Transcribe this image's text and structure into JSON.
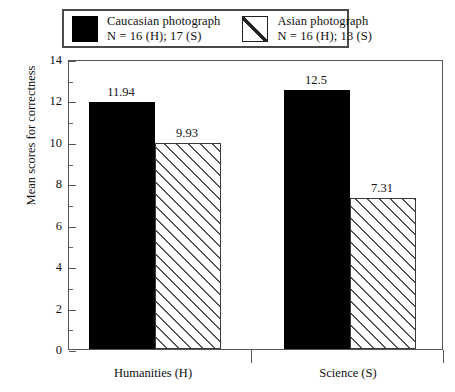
{
  "chart_data": {
    "type": "bar",
    "title": "",
    "xlabel": "",
    "ylabel": "Mean scores for correctness",
    "ylim": [
      0,
      14
    ],
    "ytick_step": 2,
    "yminor_step": 1,
    "grid": false,
    "legend_position": "top",
    "categories": [
      "Humanities (H)",
      "Science (S)"
    ],
    "series": [
      {
        "name": "Caucasian photograph",
        "sublabel": "N = 16 (H); 17 (S)",
        "fill": "solid-black",
        "color": "#000000",
        "values": [
          11.94,
          12.5
        ],
        "value_labels": [
          "11.94",
          "12.5"
        ]
      },
      {
        "name": "Asian photograph",
        "sublabel": "N = 16 (H); 13 (S)",
        "fill": "diagonal-hatch",
        "color": "#ffffff",
        "values": [
          9.93,
          7.31
        ],
        "value_labels": [
          "9.93",
          "7.31"
        ]
      }
    ],
    "ytick_labels": [
      "14",
      "12",
      "10",
      "8",
      "6",
      "4",
      "2",
      "0"
    ],
    "ytick_values": [
      14,
      12,
      10,
      8,
      6,
      4,
      2,
      0
    ]
  },
  "legend": {
    "entries": [
      {
        "label": "Caucasian photograph",
        "sublabel": "N = 16 (H); 17 (S)",
        "swatch": "solid-black-swatch"
      },
      {
        "label": "Asian photograph",
        "sublabel": "N = 16 (H); 13 (S)",
        "swatch": "diagonal-hatch-swatch"
      }
    ]
  },
  "axes": {
    "y_title": "Mean scores for correctness",
    "x_categories": [
      "Humanities (H)",
      "Science (S)"
    ]
  }
}
